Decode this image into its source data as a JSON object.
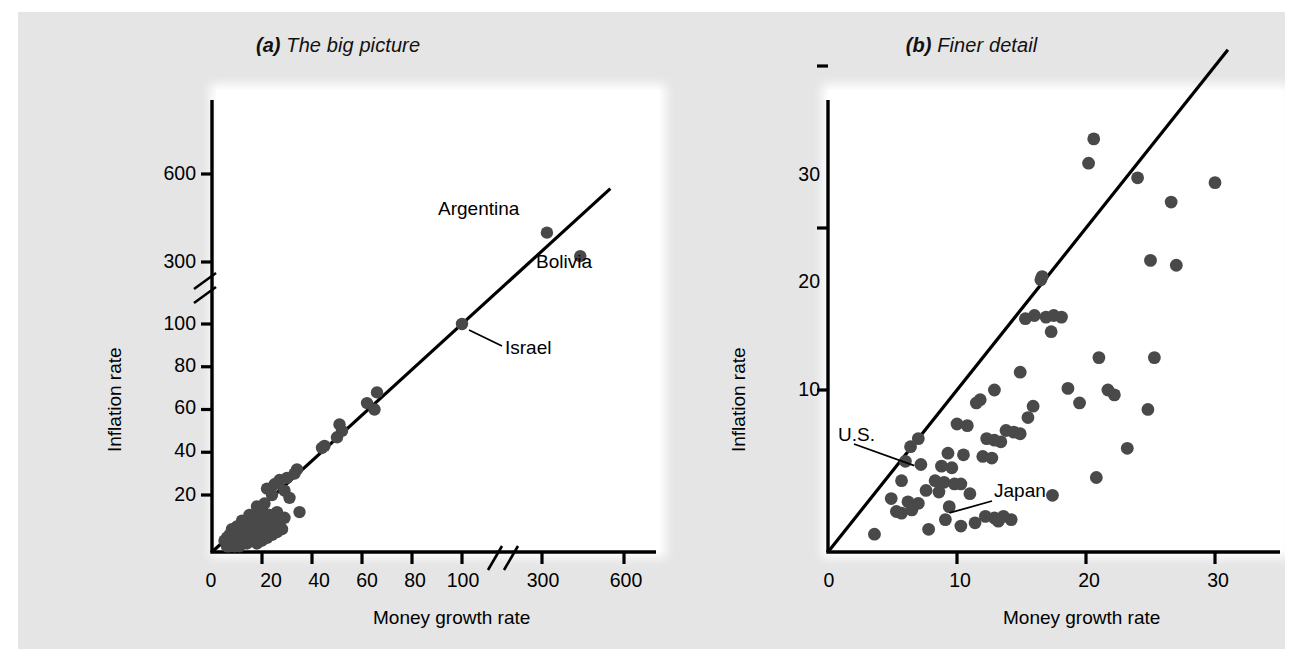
{
  "figure": {
    "background_color": "#e5e5e5",
    "plot_background_color": "#ffffff",
    "dot_color": "#494949",
    "line_color": "#000000"
  },
  "chart_data": [
    {
      "type": "scatter",
      "panel": "a",
      "title": "The big picture",
      "title_tag": "(a)",
      "xlabel": "Money growth rate",
      "ylabel": "Inflation rate",
      "xticks": [
        "0",
        "20",
        "40",
        "60",
        "80",
        "100",
        "300",
        "600"
      ],
      "xtick_values": [
        0,
        20,
        40,
        60,
        80,
        100,
        300,
        600
      ],
      "yticks": [
        "20",
        "40",
        "60",
        "80",
        "100",
        "300",
        "600"
      ],
      "ytick_values": [
        20,
        40,
        60,
        80,
        100,
        300,
        600
      ],
      "axis_break_x": true,
      "axis_break_y": true,
      "grid": false,
      "legend": "none",
      "reference_line": {
        "type": "45-degree line",
        "from": [
          0,
          0
        ],
        "to": [
          600,
          600
        ]
      },
      "annotations": [
        {
          "label": "Argentina",
          "x": 320,
          "y": 400
        },
        {
          "label": "Bolivia",
          "x": 440,
          "y": 320
        },
        {
          "label": "Israel",
          "x": 100,
          "y": 100,
          "leader": true
        }
      ],
      "points": [
        [
          318,
          400
        ],
        [
          440,
          320
        ],
        [
          100,
          100
        ],
        [
          66,
          68
        ],
        [
          62,
          63
        ],
        [
          65,
          60
        ],
        [
          51,
          53
        ],
        [
          52,
          50
        ],
        [
          45,
          43
        ],
        [
          50,
          47
        ],
        [
          44,
          42
        ],
        [
          34,
          32
        ],
        [
          33,
          30
        ],
        [
          30,
          28
        ],
        [
          27,
          27
        ],
        [
          25,
          25
        ],
        [
          29,
          22
        ],
        [
          31,
          19
        ],
        [
          24,
          20
        ],
        [
          22,
          23
        ],
        [
          21,
          17
        ],
        [
          20,
          15
        ],
        [
          26,
          14
        ],
        [
          19,
          13
        ],
        [
          18,
          16
        ],
        [
          17,
          12
        ],
        [
          16,
          11
        ],
        [
          15,
          13
        ],
        [
          14,
          10
        ],
        [
          13,
          9
        ],
        [
          12,
          11
        ],
        [
          11,
          8
        ],
        [
          10,
          9
        ],
        [
          9,
          7
        ],
        [
          8,
          8
        ],
        [
          7,
          6
        ],
        [
          12,
          6
        ],
        [
          14,
          7
        ],
        [
          16,
          8
        ],
        [
          18,
          9
        ],
        [
          20,
          10
        ],
        [
          22,
          11
        ],
        [
          23,
          9
        ],
        [
          25,
          12
        ],
        [
          27,
          10
        ],
        [
          29,
          12
        ],
        [
          6,
          5
        ],
        [
          5,
          4
        ],
        [
          9,
          4
        ],
        [
          11,
          5
        ],
        [
          13,
          4
        ],
        [
          15,
          5
        ],
        [
          17,
          6
        ],
        [
          19,
          5
        ],
        [
          21,
          7
        ],
        [
          8,
          3
        ],
        [
          10,
          3
        ],
        [
          12,
          3
        ],
        [
          14,
          3
        ],
        [
          7,
          2
        ],
        [
          9,
          2
        ],
        [
          11,
          2
        ],
        [
          16,
          4
        ],
        [
          18,
          3
        ],
        [
          20,
          4
        ],
        [
          22,
          5
        ],
        [
          24,
          6
        ],
        [
          26,
          7
        ],
        [
          28,
          8
        ],
        [
          6,
          2
        ],
        [
          23,
          13
        ],
        [
          35,
          14
        ]
      ]
    },
    {
      "type": "scatter",
      "panel": "b",
      "title": "Finer detail",
      "title_tag": "(b)",
      "xlabel": "Money growth rate",
      "ylabel": "Inflation rate",
      "xticks": [
        "0",
        "10",
        "20",
        "30"
      ],
      "xtick_values": [
        0,
        10,
        20,
        30
      ],
      "yticks": [
        "10",
        "20",
        "30"
      ],
      "ytick_values": [
        10,
        20,
        30
      ],
      "xlim": [
        0,
        34
      ],
      "ylim": [
        0,
        35
      ],
      "grid": false,
      "legend": "none",
      "reference_line": {
        "type": "45-degree line",
        "from": [
          0,
          0
        ],
        "to": [
          31,
          31
        ]
      },
      "annotations": [
        {
          "label": "U.S.",
          "x": 6.3,
          "y": 6.2,
          "leader": true
        },
        {
          "label": "Japan",
          "x": 9.1,
          "y": 2.1,
          "leader": true
        }
      ],
      "points": [
        [
          20.6,
          25.5
        ],
        [
          20.2,
          24.0
        ],
        [
          24.0,
          23.1
        ],
        [
          30.0,
          22.8
        ],
        [
          26.6,
          21.6
        ],
        [
          25.0,
          18.0
        ],
        [
          27.0,
          17.7
        ],
        [
          16.6,
          17.0
        ],
        [
          16.5,
          16.8
        ],
        [
          16.0,
          14.6
        ],
        [
          17.5,
          14.6
        ],
        [
          16.9,
          14.5
        ],
        [
          15.3,
          14.4
        ],
        [
          17.3,
          13.6
        ],
        [
          21.0,
          12.0
        ],
        [
          25.3,
          12.0
        ],
        [
          14.9,
          11.1
        ],
        [
          18.6,
          10.1
        ],
        [
          21.7,
          10.0
        ],
        [
          22.2,
          9.7
        ],
        [
          12.9,
          10.0
        ],
        [
          11.8,
          9.4
        ],
        [
          11.5,
          9.2
        ],
        [
          19.5,
          9.2
        ],
        [
          24.8,
          8.8
        ],
        [
          15.5,
          8.3
        ],
        [
          10.0,
          7.9
        ],
        [
          10.8,
          7.8
        ],
        [
          13.8,
          7.5
        ],
        [
          14.4,
          7.4
        ],
        [
          14.9,
          7.3
        ],
        [
          7.0,
          7.0
        ],
        [
          12.3,
          7.0
        ],
        [
          12.9,
          6.9
        ],
        [
          13.4,
          6.8
        ],
        [
          6.4,
          6.5
        ],
        [
          23.2,
          6.4
        ],
        [
          9.3,
          6.1
        ],
        [
          10.5,
          6.0
        ],
        [
          12.0,
          5.9
        ],
        [
          12.7,
          5.8
        ],
        [
          6.0,
          5.6
        ],
        [
          7.2,
          5.4
        ],
        [
          8.8,
          5.3
        ],
        [
          9.6,
          5.2
        ],
        [
          20.8,
          4.6
        ],
        [
          5.7,
          4.4
        ],
        [
          8.3,
          4.4
        ],
        [
          9.0,
          4.3
        ],
        [
          9.8,
          4.2
        ],
        [
          10.3,
          4.2
        ],
        [
          7.6,
          3.8
        ],
        [
          8.6,
          3.7
        ],
        [
          17.4,
          3.5
        ],
        [
          4.9,
          3.3
        ],
        [
          6.2,
          3.1
        ],
        [
          7.0,
          3.0
        ],
        [
          9.4,
          2.8
        ],
        [
          6.5,
          2.6
        ],
        [
          5.3,
          2.5
        ],
        [
          5.7,
          2.4
        ],
        [
          12.2,
          2.2
        ],
        [
          12.9,
          2.1
        ],
        [
          13.6,
          2.2
        ],
        [
          9.1,
          2.0
        ],
        [
          11.4,
          1.8
        ],
        [
          10.3,
          1.6
        ],
        [
          7.8,
          1.4
        ],
        [
          3.6,
          1.1
        ],
        [
          14.2,
          2.0
        ],
        [
          13.2,
          1.9
        ],
        [
          11.0,
          3.6
        ],
        [
          15.9,
          9.0
        ],
        [
          18.1,
          14.5
        ]
      ]
    }
  ]
}
